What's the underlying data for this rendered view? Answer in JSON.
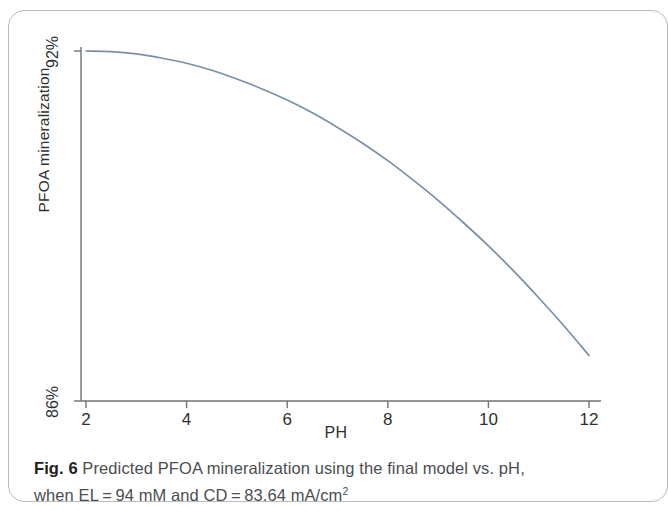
{
  "figure": {
    "caption_label": "Fig. 6",
    "caption_line1": " Predicted PFOA mineralization using the final model vs. pH,",
    "caption_line2_a": "when EL = 94 mM and CD = 83.64 mA/cm",
    "caption_superscript": "2"
  },
  "colors": {
    "curve": "#7a8fa6",
    "axis": "#6e7376",
    "text": "#2e3133",
    "card_border": "#b9bcbe"
  },
  "chart_data": {
    "type": "line",
    "title": "",
    "xlabel": "PH",
    "ylabel": "PFOA mineralization",
    "xlim": [
      2,
      12
    ],
    "ylim": [
      86,
      92
    ],
    "xticks": [
      2,
      4,
      6,
      8,
      10,
      12
    ],
    "xtick_labels": [
      "2",
      "4",
      "6",
      "8",
      "10",
      "12"
    ],
    "yticks": [
      86,
      92
    ],
    "ytick_labels": [
      "86%",
      "92%"
    ],
    "grid": false,
    "legend": "none",
    "series": [
      {
        "name": "Predicted PFOA mineralization",
        "x": [
          2,
          2.5,
          3,
          3.5,
          4,
          4.5,
          5,
          5.5,
          6,
          6.5,
          7,
          7.5,
          8,
          8.5,
          9,
          9.5,
          10,
          10.5,
          11,
          11.5,
          12
        ],
        "values": [
          92.0,
          91.99,
          91.95,
          91.88,
          91.79,
          91.67,
          91.52,
          91.35,
          91.16,
          90.94,
          90.69,
          90.42,
          90.12,
          89.79,
          89.44,
          89.06,
          88.66,
          88.23,
          87.77,
          87.29,
          86.78
        ]
      }
    ]
  }
}
